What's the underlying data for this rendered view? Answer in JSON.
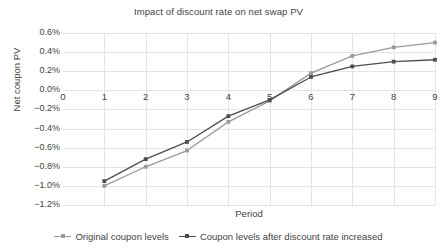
{
  "chart_data": {
    "type": "line",
    "title": "Impact of discount rate on net swap PV",
    "xlabel": "Period",
    "ylabel": "Net coupon PV",
    "x": [
      1,
      2,
      3,
      4,
      5,
      6,
      7,
      8,
      9
    ],
    "xlim": [
      0,
      9
    ],
    "ylim": [
      -0.012,
      0.006
    ],
    "x_tick_labels": [
      "0",
      "1",
      "2",
      "3",
      "4",
      "5",
      "6",
      "7",
      "8",
      "9"
    ],
    "y_tick_labels": [
      "0.6%",
      "0.4%",
      "0.2%",
      "0.0%",
      "−0.2%",
      "−0.4%",
      "−0.6%",
      "−0.8%",
      "−1.0%",
      "−1.2%"
    ],
    "y_tick_values": [
      0.006,
      0.004,
      0.002,
      0.0,
      -0.002,
      -0.004,
      -0.006,
      -0.008,
      -0.01,
      -0.012
    ],
    "grid": true,
    "legend_position": "bottom",
    "series": [
      {
        "name": "Original coupon levels",
        "color": "#9a9a9a",
        "values": [
          -0.01,
          -0.008,
          -0.0063,
          -0.0033,
          -0.0011,
          0.0018,
          0.0036,
          0.0045,
          0.005
        ]
      },
      {
        "name": "Coupon levels after discount rate increased",
        "color": "#4d4d4d",
        "values": [
          -0.0095,
          -0.0072,
          -0.0054,
          -0.0027,
          -0.001,
          0.0014,
          0.0025,
          0.003,
          0.0032
        ]
      }
    ]
  }
}
